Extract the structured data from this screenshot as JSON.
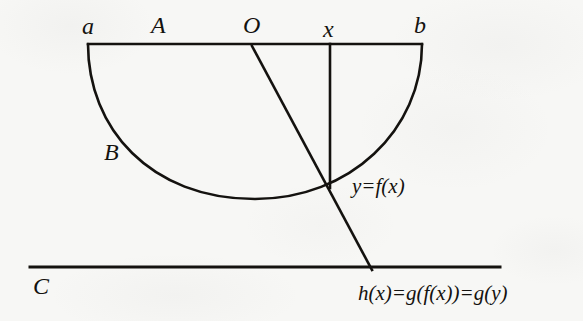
{
  "figure": {
    "type": "mathematical-diagram",
    "background_color": "#f7f7f5",
    "ink_color": "#14120f",
    "labels": {
      "point_a": "a",
      "segment_A": "A",
      "origin_O": "O",
      "point_x": "x",
      "point_b": "b",
      "curve_B": "B",
      "line_C": "C",
      "curve_equation": "y=f(x)",
      "composition_equation": "h(x)=g(f(x))=g(y)"
    },
    "geometry": {
      "top_line": {
        "x1": 88,
        "y1": 44,
        "x2": 422,
        "y2": 44
      },
      "bottom_line": {
        "x1": 30,
        "y1": 267,
        "x2": 500,
        "y2": 267
      },
      "vertical_line": {
        "x1": 330,
        "y1": 44,
        "x2": 330,
        "y2": 188
      },
      "slanted_line": {
        "x1": 252,
        "y1": 46,
        "x2": 372,
        "y2": 270
      },
      "curve_endpoints": {
        "left": [
          88,
          44
        ],
        "right": [
          422,
          44
        ]
      },
      "curve_minimum": [
        255,
        199
      ],
      "intersection_point": [
        330,
        188
      ]
    },
    "label_positions": {
      "point_a": [
        82,
        14
      ],
      "segment_A": [
        151,
        13
      ],
      "origin_O": [
        243,
        13
      ],
      "point_x": [
        323,
        17
      ],
      "point_b": [
        414,
        13
      ],
      "curve_B": [
        104,
        140
      ],
      "line_C": [
        33,
        274
      ],
      "curve_equation": [
        352,
        176
      ],
      "composition_equation": [
        358,
        283
      ]
    }
  }
}
